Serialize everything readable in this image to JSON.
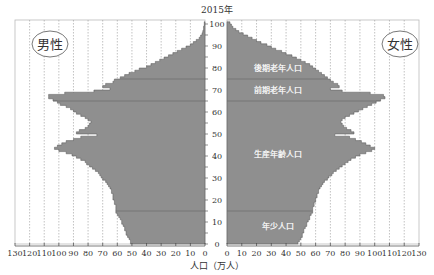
{
  "chart_data": {
    "type": "bar",
    "subtype": "population-pyramid",
    "title": "2015年",
    "xlabel": "人口（万人）",
    "ylabel": "",
    "left_series_label": "男性",
    "right_series_label": "女性",
    "x_ticks_left": [
      130,
      120,
      110,
      100,
      90,
      80,
      70,
      60,
      50,
      40,
      30,
      20,
      10,
      0
    ],
    "x_ticks_right": [
      0,
      10,
      20,
      30,
      40,
      50,
      60,
      70,
      80,
      90,
      100,
      110,
      120,
      130
    ],
    "xlim": [
      0,
      130
    ],
    "y_ticks": [
      0,
      10,
      20,
      30,
      40,
      50,
      60,
      70,
      80,
      90,
      100
    ],
    "ylim": [
      0,
      100
    ],
    "grid": "vertical dashed every 10",
    "age_groups": [
      {
        "label": "年少人口",
        "range": [
          0,
          14
        ]
      },
      {
        "label": "生産年齢人口",
        "range": [
          15,
          64
        ]
      },
      {
        "label": "前期老年人口",
        "range": [
          65,
          74
        ]
      },
      {
        "label": "後期老年人口",
        "range": [
          75,
          100
        ]
      }
    ],
    "boundary_ages": [
      15,
      65,
      75
    ],
    "ages": [
      0,
      1,
      2,
      3,
      4,
      5,
      6,
      7,
      8,
      9,
      10,
      11,
      12,
      13,
      14,
      15,
      16,
      17,
      18,
      19,
      20,
      21,
      22,
      23,
      24,
      25,
      26,
      27,
      28,
      29,
      30,
      31,
      32,
      33,
      34,
      35,
      36,
      37,
      38,
      39,
      40,
      41,
      42,
      43,
      44,
      45,
      46,
      47,
      48,
      49,
      50,
      51,
      52,
      53,
      54,
      55,
      56,
      57,
      58,
      59,
      60,
      61,
      62,
      63,
      64,
      65,
      66,
      67,
      68,
      69,
      70,
      71,
      72,
      73,
      74,
      75,
      76,
      77,
      78,
      79,
      80,
      81,
      82,
      83,
      84,
      85,
      86,
      87,
      88,
      89,
      90,
      91,
      92,
      93,
      94,
      95,
      96,
      97,
      98,
      99,
      100
    ],
    "series": [
      {
        "name": "男性",
        "side": "left",
        "values": [
          51,
          51,
          52,
          53,
          54,
          54,
          55,
          55,
          56,
          57,
          57,
          58,
          59,
          60,
          61,
          61,
          61,
          61,
          62,
          62,
          63,
          63,
          63,
          64,
          64,
          65,
          66,
          67,
          68,
          70,
          71,
          72,
          73,
          75,
          77,
          79,
          81,
          82,
          85,
          88,
          91,
          95,
          100,
          103,
          101,
          98,
          95,
          90,
          85,
          74,
          88,
          86,
          82,
          80,
          79,
          78,
          80,
          82,
          85,
          88,
          90,
          92,
          95,
          99,
          101,
          104,
          107,
          107,
          96,
          76,
          65,
          70,
          68,
          63,
          62,
          58,
          55,
          52,
          48,
          45,
          40,
          37,
          34,
          31,
          28,
          25,
          22,
          19,
          16,
          13,
          10,
          8,
          6,
          4,
          3,
          2,
          1.5,
          1,
          1,
          0.5,
          0.5
        ]
      },
      {
        "name": "女性",
        "side": "right",
        "values": [
          48,
          49,
          50,
          51,
          51,
          52,
          52,
          53,
          54,
          54,
          55,
          56,
          56,
          57,
          58,
          58,
          58,
          59,
          59,
          60,
          60,
          61,
          61,
          62,
          62,
          63,
          64,
          65,
          66,
          68,
          69,
          71,
          72,
          74,
          76,
          78,
          80,
          82,
          84,
          87,
          90,
          94,
          98,
          100,
          97,
          94,
          91,
          87,
          83,
          73,
          86,
          84,
          81,
          79,
          78,
          77,
          78,
          80,
          83,
          86,
          89,
          92,
          95,
          98,
          101,
          104,
          107,
          106,
          97,
          78,
          70,
          76,
          75,
          72,
          70,
          68,
          66,
          64,
          62,
          60,
          58,
          56,
          53,
          50,
          47,
          44,
          40,
          37,
          33,
          30,
          27,
          23,
          20,
          17,
          14,
          11,
          8,
          6,
          4,
          3,
          2
        ]
      }
    ]
  }
}
